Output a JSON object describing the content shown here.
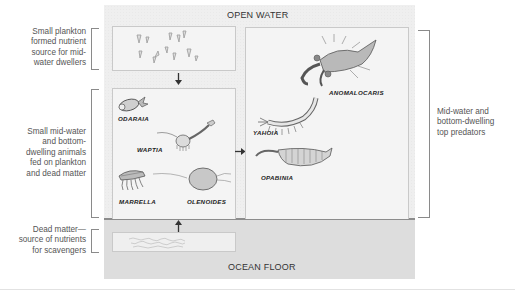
{
  "zones": {
    "top": "OPEN WATER",
    "bottom": "OCEAN FLOOR"
  },
  "side_notes": {
    "plankton": [
      "Small plankton",
      "formed nutrient",
      "source for mid-",
      "water dwellers"
    ],
    "small_animals": [
      "Small mid-water",
      "and bottom-",
      "dwelling animals",
      "fed on plankton",
      "and dead matter"
    ],
    "dead_matter": [
      "Dead matter—",
      "source of nutrients",
      "for scavengers"
    ],
    "predators": [
      "Mid-water and",
      "bottom-dwelling",
      "top predators"
    ]
  },
  "creatures": {
    "small": [
      {
        "name": "ODARAIA"
      },
      {
        "name": "WAPTIA"
      },
      {
        "name": "MARRELLA"
      },
      {
        "name": "OLENOIDES"
      }
    ],
    "predators": [
      {
        "name": "ANOMALOCARIS"
      },
      {
        "name": "YAHOIA"
      },
      {
        "name": "OPABINIA"
      }
    ]
  },
  "arrows": [
    {
      "from": "plankton",
      "to": "small-animals",
      "direction": "down"
    },
    {
      "from": "small-animals",
      "to": "top-predators",
      "direction": "right"
    },
    {
      "from": "dead-matter",
      "to": "small-animals",
      "direction": "up"
    }
  ],
  "colors": {
    "panel": "#efefef",
    "floor": "#e9e9e9",
    "box_border": "#c9c9c9",
    "bracket": "#8a8a8a",
    "text": "#555555",
    "creature_fill": "#b8b8b8"
  }
}
